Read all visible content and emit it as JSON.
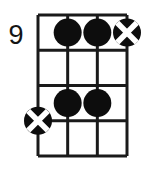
{
  "diagram": {
    "instrument_strings": 4,
    "fret_count": 4,
    "start_fret_label": "9",
    "grid": {
      "left": 38,
      "top": 15,
      "right": 127,
      "bottom": 156,
      "string_x": [
        38,
        67.67,
        97.33,
        127
      ],
      "fret_y": [
        15,
        50.25,
        85.5,
        120.75,
        156
      ],
      "line_color": "#1a1a1a",
      "line_width": 3,
      "nut_width": 3
    },
    "markers": [
      {
        "name": "dot-string2-fret1",
        "type": "filled-dot",
        "string": 2,
        "fret": 1,
        "cx": 67.67,
        "cy": 32.6,
        "r": 14,
        "color": "#0d0d0d"
      },
      {
        "name": "dot-string3-fret1",
        "type": "filled-dot",
        "string": 3,
        "fret": 1,
        "cx": 97.33,
        "cy": 32.6,
        "r": 14,
        "color": "#0d0d0d"
      },
      {
        "name": "x-circle-string4-fret1",
        "type": "x-circle",
        "string": 4,
        "fret": 1,
        "cx": 127,
        "cy": 32.6,
        "r": 14,
        "color": "#0d0d0d",
        "cross_color": "#ffffff"
      },
      {
        "name": "dot-string2-fret3",
        "type": "filled-dot",
        "string": 2,
        "fret": 3,
        "cx": 67.67,
        "cy": 103.1,
        "r": 14,
        "color": "#0d0d0d"
      },
      {
        "name": "dot-string3-fret3",
        "type": "filled-dot",
        "string": 3,
        "fret": 3,
        "cx": 97.33,
        "cy": 103.1,
        "r": 14,
        "color": "#0d0d0d"
      },
      {
        "name": "x-circle-string1-fret4",
        "type": "x-circle",
        "string": 1,
        "fret": 4,
        "cx": 38,
        "cy": 120.75,
        "r": 14,
        "color": "#0d0d0d",
        "cross_color": "#ffffff"
      }
    ],
    "colors": {
      "background": "#ffffff",
      "ink": "#1a1a1a",
      "marker_fill": "#0d0d0d",
      "marker_cross": "#ffffff"
    }
  }
}
